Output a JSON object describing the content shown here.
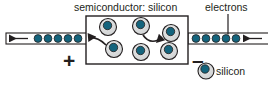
{
  "figure": {
    "type": "diagram",
    "background_color": "#ffffff",
    "line_color": "#231f20",
    "electron_color": "#14647d",
    "atom_shell_color": "#d9dada",
    "atom_core_color": "#14647d"
  },
  "labels": {
    "title": "semiconductor: silicon",
    "electrons": "electrons",
    "plus_terminal": "+",
    "minus_terminal": "–"
  },
  "legend": {
    "items": [
      {
        "swatch": "silicon-atom-icon",
        "label": "silicon"
      }
    ]
  },
  "device": {
    "box": {
      "x": 86,
      "y": 16,
      "width": 102,
      "height": 48
    },
    "atoms": [
      {
        "id": "atom-1",
        "cx": 108,
        "cy": 27,
        "r": 8.5,
        "core_dx": -0.5,
        "core_dy": -1.5
      },
      {
        "id": "atom-2",
        "cx": 141,
        "cy": 26,
        "r": 8.5,
        "core_dx": -0.5,
        "core_dy": -1.5
      },
      {
        "id": "atom-3",
        "cx": 171,
        "cy": 33,
        "r": 8.5,
        "core_dx": -0.5,
        "core_dy": -1.5
      },
      {
        "id": "atom-4",
        "cx": 114,
        "cy": 49,
        "r": 8.5,
        "core_dx": -0.5,
        "core_dy": -1.5
      },
      {
        "id": "atom-5",
        "cx": 141,
        "cy": 52,
        "r": 8.5,
        "core_dx": -0.5,
        "core_dy": -1.5
      },
      {
        "id": "atom-6",
        "cx": 169,
        "cy": 51,
        "r": 8.5,
        "core_dx": -0.5,
        "core_dy": -1.5
      }
    ],
    "hop_arrows": [
      {
        "id": "hop-arrow-inner",
        "from_atom": "atom-2",
        "to_atom": "atom-3"
      },
      {
        "id": "hop-arrow-exit",
        "from_atom": "atom-4",
        "to": "left-wire"
      }
    ]
  },
  "wires": {
    "left": {
      "id": "left-wire",
      "x": 6,
      "y": 33,
      "width": 80,
      "height": 11,
      "flow_direction": "left",
      "electron_count": 5,
      "electron_positions": [
        38,
        48,
        58,
        68,
        78
      ]
    },
    "right": {
      "id": "right-wire",
      "x": 188,
      "y": 33,
      "width": 80,
      "height": 11,
      "flow_direction": "left",
      "electron_count": 5,
      "electron_positions": [
        196,
        206,
        216,
        226,
        236
      ]
    }
  },
  "leader_line": {
    "id": "electrons-leader",
    "x": 228,
    "y_top": 14,
    "y_bottom": 34
  }
}
